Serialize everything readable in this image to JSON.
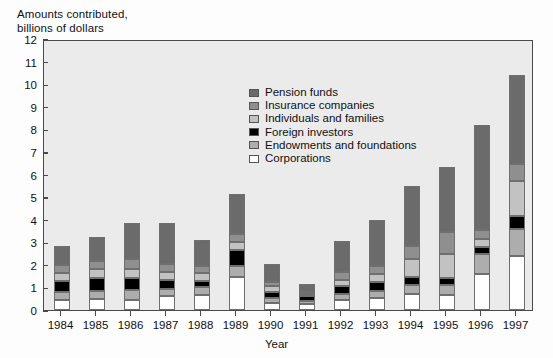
{
  "axis_title": "Amounts contributed,\nbillions of dollars",
  "xaxis_title": "Year",
  "legend": {
    "items": [
      {
        "label": "Pension funds",
        "color": "#6b6b6b"
      },
      {
        "label": "Insurance companies",
        "color": "#8f8f8f"
      },
      {
        "label": "Individuals and families",
        "color": "#c2c2c2"
      },
      {
        "label": "Foreign investors",
        "color": "#000000"
      },
      {
        "label": "Endowments and foundations",
        "color": "#adadad"
      },
      {
        "label": "Corporations",
        "color": "#ffffff"
      }
    ]
  },
  "chart_data": {
    "type": "bar",
    "subtype": "stacked-bar",
    "title": "Amounts contributed, billions of dollars",
    "xlabel": "Year",
    "ylabel": "Amounts contributed, billions of dollars",
    "ylim": [
      0,
      12
    ],
    "ytick_labels": [
      "0",
      "1",
      "2",
      "3",
      "4",
      "5",
      "6",
      "7",
      "8",
      "9",
      "10",
      "11",
      "12"
    ],
    "ytick_values": [
      0,
      1,
      2,
      3,
      4,
      5,
      6,
      7,
      8,
      9,
      10,
      11,
      12
    ],
    "grid": false,
    "legend_position": "inside-top-center",
    "categories": [
      "1984",
      "1985",
      "1986",
      "1987",
      "1988",
      "1989",
      "1990",
      "1991",
      "1992",
      "1993",
      "1994",
      "1995",
      "1996",
      "1997"
    ],
    "stack_order_bottom_to_top": [
      "Corporations",
      "Endowments and foundations",
      "Foreign investors",
      "Individuals and families",
      "Insurance companies",
      "Pension funds"
    ],
    "series": [
      {
        "name": "Corporations",
        "color": "#ffffff",
        "values": [
          0.45,
          0.5,
          0.45,
          0.6,
          0.65,
          1.45,
          0.3,
          0.25,
          0.45,
          0.55,
          0.7,
          0.65,
          1.6,
          2.4
        ]
      },
      {
        "name": "Endowments and foundations",
        "color": "#adadad",
        "values": [
          0.35,
          0.35,
          0.45,
          0.35,
          0.35,
          0.5,
          0.25,
          0.15,
          0.25,
          0.3,
          0.4,
          0.45,
          0.9,
          1.2
        ]
      },
      {
        "name": "Foreign investors",
        "color": "#000000",
        "values": [
          0.5,
          0.55,
          0.5,
          0.4,
          0.3,
          0.7,
          0.25,
          0.2,
          0.35,
          0.4,
          0.35,
          0.3,
          0.3,
          0.55
        ]
      },
      {
        "name": "Individuals and families",
        "color": "#c2c2c2",
        "values": [
          0.35,
          0.4,
          0.4,
          0.35,
          0.35,
          0.35,
          0.25,
          0.1,
          0.3,
          0.35,
          0.8,
          1.1,
          0.35,
          1.55
        ]
      },
      {
        "name": "Insurance companies",
        "color": "#8f8f8f",
        "values": [
          0.35,
          0.35,
          0.45,
          0.35,
          0.3,
          0.35,
          0.2,
          0.1,
          0.35,
          0.35,
          0.6,
          0.95,
          0.4,
          0.75
        ]
      },
      {
        "name": "Pension funds",
        "color": "#6b6b6b",
        "values": [
          0.85,
          1.1,
          1.6,
          1.8,
          1.15,
          1.8,
          0.8,
          0.35,
          1.35,
          2.05,
          2.65,
          2.9,
          4.65,
          3.95
        ]
      }
    ],
    "totals": [
      2.85,
      3.25,
      3.85,
      3.85,
      3.1,
      5.15,
      2.05,
      1.15,
      3.05,
      4.0,
      5.5,
      6.35,
      8.2,
      10.4
    ]
  }
}
